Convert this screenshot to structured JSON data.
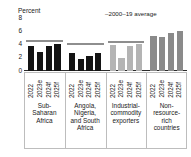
{
  "chart_data": {
    "type": "bar",
    "title": "",
    "ylabel": "Percent",
    "xlabel": "",
    "ylim": [
      0,
      8
    ],
    "yticks": [
      0,
      2,
      4,
      6,
      8
    ],
    "grid": false,
    "legend": {
      "position": "top-right",
      "entries": [
        {
          "label": "2000–19 average",
          "marker": "line",
          "color": "#8e8e8e"
        }
      ]
    },
    "categories": [
      "2022",
      "2023e",
      "2024f",
      "2025f"
    ],
    "groups": [
      {
        "name": "Sub-Saharan Africa",
        "name_lines": [
          "Sub-",
          "Saharan",
          "Africa"
        ],
        "color": "#141414",
        "values": [
          3.8,
          2.9,
          3.8,
          4.1
        ],
        "average": 4.4
      },
      {
        "name": "Angola, Nigeria, and South Africa",
        "name_lines": [
          "Angola,",
          "Nigeria,",
          "and South",
          "Africa"
        ],
        "color": "#141414",
        "values": [
          2.7,
          1.8,
          2.3,
          2.7
        ],
        "average": 4.0
      },
      {
        "name": "Industrial-commodity exporters",
        "name_lines": [
          "Industrial-",
          "commodity",
          "exporters"
        ],
        "color": "#b4b4b4",
        "values": [
          4.0,
          1.9,
          3.8,
          4.1
        ],
        "average": 4.3
      },
      {
        "name": "Non-resource-rich countries",
        "name_lines": [
          "Non-",
          "resource-",
          "rich",
          "countries"
        ],
        "color": "#8a8a8a",
        "values": [
          5.3,
          5.2,
          5.8,
          6.0
        ],
        "average": null
      }
    ]
  },
  "axis": {
    "unit_label": "Percent",
    "tick_0": "0",
    "tick_2": "2",
    "tick_4": "4",
    "tick_6": "6",
    "tick_8": "8"
  },
  "legend": {
    "average_label": "–2000–19 average"
  },
  "xlabels": {
    "g0": [
      "2022",
      "2023e",
      "2024f",
      "2025f"
    ],
    "g1": [
      "2022",
      "2023e",
      "2024f",
      "2025f"
    ],
    "g2": [
      "2022",
      "2023e",
      "2024f",
      "2025f"
    ],
    "g3": [
      "2022",
      "2023e",
      "2024f",
      "2025f"
    ]
  },
  "grouplabels": {
    "g0": "Sub-\nSaharan\nAfrica",
    "g1": "Angola,\nNigeria,\nand South\nAfrica",
    "g2": "Industrial-\ncommodity\nexporters",
    "g3": "Non-\nresource-\nrich\ncountries"
  }
}
